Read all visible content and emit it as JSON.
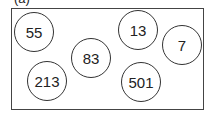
{
  "caption": "(a)",
  "nodes": [
    {
      "label": "55",
      "cx": 34,
      "cy": 32
    },
    {
      "label": "13",
      "cx": 138,
      "cy": 30
    },
    {
      "label": "7",
      "cx": 182,
      "cy": 44
    },
    {
      "label": "83",
      "cx": 91,
      "cy": 58
    },
    {
      "label": "213",
      "cx": 47,
      "cy": 81
    },
    {
      "label": "501",
      "cx": 141,
      "cy": 82
    }
  ]
}
